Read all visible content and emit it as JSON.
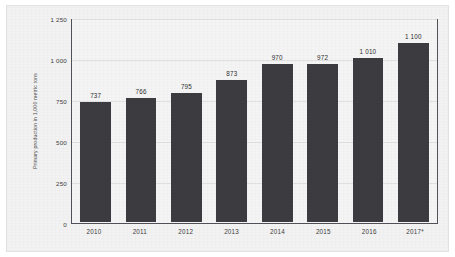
{
  "chart_data": {
    "type": "bar",
    "title": "",
    "subtitle": "",
    "xlabel": "",
    "ylabel": "Primary production in 1,000 metric tons",
    "categories": [
      "2010",
      "2011",
      "2012",
      "2013",
      "2014",
      "2015",
      "2016",
      "2017*"
    ],
    "values": [
      737,
      766,
      795,
      873,
      970,
      972,
      1010,
      1100
    ],
    "value_labels": [
      "737",
      "766",
      "795",
      "873",
      "970",
      "972",
      "1 010",
      "1 100"
    ],
    "ylim": [
      0,
      1250
    ],
    "ytick_values": [
      1250,
      1000,
      750,
      500,
      250,
      0
    ],
    "ytick_labels": [
      "1 250",
      "1 000",
      "750",
      "500",
      "250",
      "0"
    ],
    "grid": true,
    "legend": "none",
    "series": [
      {
        "name": "Primary production",
        "values": [
          737,
          766,
          795,
          873,
          970,
          972,
          1010,
          1100
        ]
      }
    ],
    "colors": {
      "bar": "#3b3b40",
      "plot_background": "#f4f4f4",
      "card_background": "#f2f2f2",
      "axis_border": "#51515a",
      "gridline": "#e0e0e0",
      "text": "#3c3c3c"
    },
    "annotations": [
      "2017* denotes an estimated or provisional value"
    ]
  }
}
